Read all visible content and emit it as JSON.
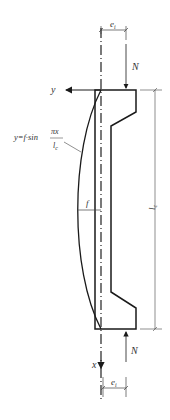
{
  "figure": {
    "type": "eccentric-column-deflection-diagram",
    "labels": {
      "axis_y": "y",
      "axis_x": "x",
      "force_top": "N",
      "force_bottom": "N",
      "eccentricity_top": "e",
      "eccentricity_top_sub": "i",
      "eccentricity_bottom": "e",
      "eccentricity_bottom_sub": "i",
      "deflection": "f",
      "length": "l",
      "length_sub": "c",
      "equation_lhs": "y=f·sin",
      "equation_num": "πx",
      "equation_den": "l",
      "equation_den_sub": "c"
    },
    "colors": {
      "stroke": "#1a1a1a",
      "thin": "#444444",
      "text": "#333333"
    }
  }
}
